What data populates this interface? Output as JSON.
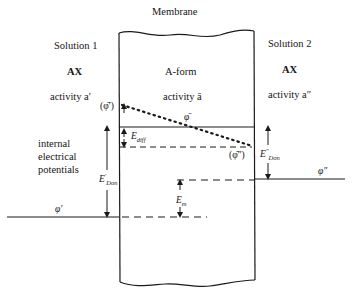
{
  "diagram": {
    "title": "Membrane",
    "solution1": {
      "title": "Solution 1",
      "species": "AX",
      "activity_label": "activity a′",
      "phi_label": "φ′"
    },
    "membrane_region": {
      "form": "A-form",
      "activity_label": "activity ā",
      "phi_bar_label": "φ̄",
      "phi_bar_prime_label": "(φ̄′)",
      "phi_bar_dprime_label": "(φ̄″)"
    },
    "solution2": {
      "title": "Solution 2",
      "species": "AX",
      "activity_label": "activity a″",
      "phi_label": "φ″"
    },
    "side_label": {
      "line1": "internal",
      "line2": "electrical",
      "line3": "potentials"
    },
    "potentials": {
      "e_diff": {
        "main": "E",
        "sub": "diff"
      },
      "e_don_prime": {
        "main": "E",
        "sup": "′",
        "sub": "Don"
      },
      "e_don_dprime": {
        "main": "E",
        "sup": "″",
        "sub": "Don"
      },
      "e_m": {
        "main": "E",
        "sub": "m"
      }
    },
    "colors": {
      "line": "#1a1a1a",
      "background": "#ffffff"
    }
  }
}
